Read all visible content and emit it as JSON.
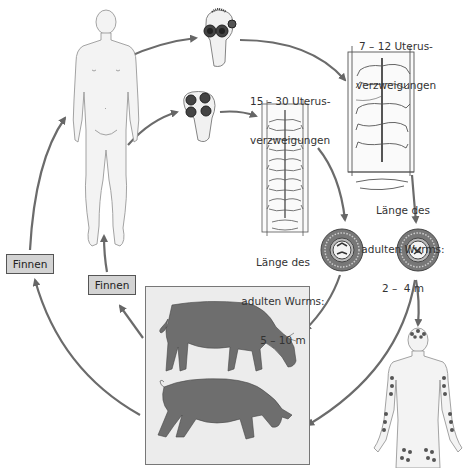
{
  "diagram": {
    "nodes": {
      "human_host": {
        "label": "Mensch (Endwirt)"
      },
      "scolex_saginata": {
        "label": "Skolex mit 4 Saugnäpfen und Hakenkranz"
      },
      "scolex_solium": {
        "label": "Skolex mit 4 Saugnäpfen"
      },
      "proglottid_saginata": {
        "caption_line1": "15 – 30 Uterus-",
        "caption_line2": "verzweigungen"
      },
      "proglottid_solium": {
        "caption_line1": "7 – 12 Uterus-",
        "caption_line2": "verzweigungen"
      },
      "length_saginata": {
        "line1": "Länge des",
        "line2": "adulten Wurms:",
        "line3": "5 – 10 m"
      },
      "length_solium": {
        "line1": "Länge des",
        "line2": "adulten Wurms:",
        "line3": "2 –  4 m"
      },
      "egg_left": {
        "label": "Ei"
      },
      "egg_right": {
        "label": "Ei"
      },
      "intermediate_hosts": {
        "cow": "Rind",
        "pig": "Schwein"
      },
      "human_cysticercosis": {
        "label": "Zystizerkose beim Menschen"
      }
    },
    "finnen_left": "Finnen",
    "finnen_right": "Finnen"
  },
  "colors": {
    "arrow": "#6b6b6b",
    "animal": "#6e6e6e",
    "animal_box_bg": "#ececec",
    "finnen_bg": "#d3d3d3",
    "body_fill": "#f2f2f2",
    "line": "#555555",
    "cyst_dot": "#555555"
  }
}
